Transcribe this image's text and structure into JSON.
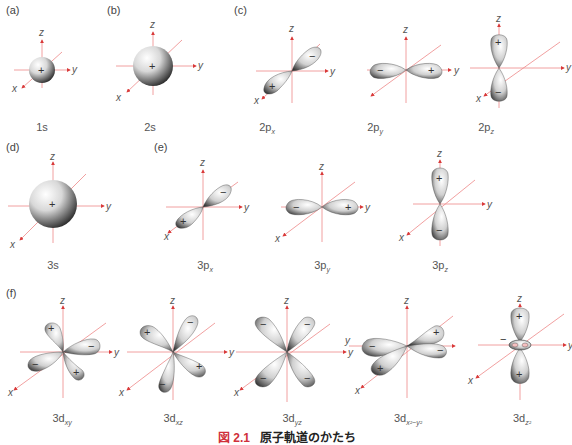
{
  "figure": {
    "number": "図 2.1",
    "title": "原子軌道のかたち"
  },
  "colors": {
    "axis": "#e05a5a",
    "axis_arrow": "#d93a3a",
    "lobe_light": "#ffffff",
    "lobe_dark": "#3a3a3a",
    "text": "#555555"
  },
  "axes_labels": {
    "x": "x",
    "y": "y",
    "z": "z"
  },
  "panels": [
    {
      "id": "a",
      "label": "(a)"
    },
    {
      "id": "b",
      "label": "(b)"
    },
    {
      "id": "c",
      "label": "(c)"
    },
    {
      "id": "d",
      "label": "(d)"
    },
    {
      "id": "e",
      "label": "(e)"
    },
    {
      "id": "f",
      "label": "(f)"
    }
  ],
  "orbitals": {
    "1s": {
      "main": "1s",
      "sub": "",
      "signs": [
        "+"
      ]
    },
    "2s": {
      "main": "2s",
      "sub": "",
      "signs": [
        "+"
      ]
    },
    "2px": {
      "main": "2p",
      "sub": "x",
      "signs": [
        "+",
        "−"
      ]
    },
    "2py": {
      "main": "2p",
      "sub": "y",
      "signs": [
        "−",
        "+"
      ]
    },
    "2pz": {
      "main": "2p",
      "sub": "z",
      "signs": [
        "+",
        "−"
      ]
    },
    "3s": {
      "main": "3s",
      "sub": "",
      "signs": [
        "+"
      ]
    },
    "3px": {
      "main": "3p",
      "sub": "x",
      "signs": [
        "+",
        "−"
      ]
    },
    "3py": {
      "main": "3p",
      "sub": "y",
      "signs": [
        "−",
        "+"
      ]
    },
    "3pz": {
      "main": "3p",
      "sub": "z",
      "signs": [
        "+",
        "−"
      ]
    },
    "3dxy": {
      "main": "3d",
      "sub": "xy",
      "signs": [
        "+",
        "−",
        "−",
        "+"
      ]
    },
    "3dxz": {
      "main": "3d",
      "sub": "xz",
      "signs": [
        "+",
        "−",
        "−",
        "+"
      ]
    },
    "3dyz": {
      "main": "3d",
      "sub": "yz",
      "signs": [
        "−",
        "−",
        "−",
        "−"
      ]
    },
    "3dx2y2": {
      "main": "3d",
      "sub": "x²−y²",
      "signs": [
        "+",
        "−",
        "+",
        "−"
      ]
    },
    "3dz2": {
      "main": "3d",
      "sub": "z²",
      "signs": [
        "+",
        "+",
        "−"
      ]
    }
  }
}
